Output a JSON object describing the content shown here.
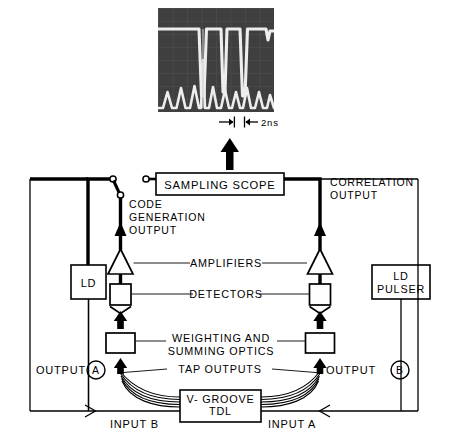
{
  "figure": {
    "scope_photo": {
      "name": "sampling-scope-trace-photo",
      "timebase_label": "2ns",
      "trace_description": "upper flat-topped code trace with three narrow downward notches and lower sawtooth correlation trace with central tall peak"
    },
    "blocks": {
      "sampling_scope": "SAMPLING SCOPE",
      "ld": "LD",
      "ld_pulser_line1": "LD",
      "ld_pulser_line2": "PULSER",
      "tdl_line1": "V- GROOVE",
      "tdl_line2": "TDL"
    },
    "labels": {
      "code_generation_output_l1": "CODE",
      "code_generation_output_l2": "GENERATION",
      "code_generation_output_l3": "OUTPUT",
      "correlation_output_l1": "CORRELATION",
      "correlation_output_l2": "OUTPUT",
      "amplifiers": "AMPLIFIERS",
      "detectors": "DETECTORS",
      "weighting_l1": "WEIGHTING AND",
      "weighting_l2": "SUMMING OPTICS",
      "tap_outputs": "TAP OUTPUTS",
      "output_a_text": "OUTPUT",
      "output_a_tag": "A",
      "output_b_text": "OUTPUT",
      "output_b_tag": "B",
      "input_b": "INPUT B",
      "input_a": "INPUT A"
    },
    "colors": {
      "ink": "#000000",
      "paper": "#ffffff",
      "photo_dark": "#3f3f3f",
      "photo_trace": "#e8e8e8"
    }
  }
}
